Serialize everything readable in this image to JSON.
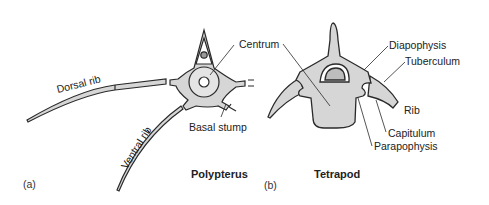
{
  "panels": [
    {
      "id": "a",
      "panel_label": "(a)",
      "title": "Polypterus",
      "labels": {
        "centrum": "Centrum",
        "dorsal_rib": "Dorsal rib",
        "ventral_rib": "Ventral rib",
        "basal_stump": "Basal stump"
      }
    },
    {
      "id": "b",
      "panel_label": "(b)",
      "title": "Tetrapod",
      "labels": {
        "diapophysis": "Diapophysis",
        "tuberculum": "Tuberculum",
        "rib": "Rib",
        "capitulum": "Capitulum",
        "parapophysis": "Parapophysis"
      }
    }
  ],
  "colors": {
    "bone_fill": "#d6d6d6",
    "outline": "#2a2a2a",
    "background": "#ffffff"
  }
}
